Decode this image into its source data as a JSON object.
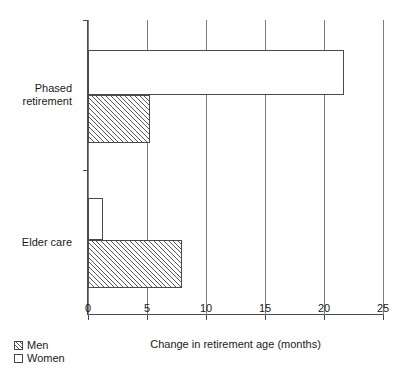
{
  "chart_data": {
    "type": "bar",
    "orientation": "horizontal",
    "title": "",
    "xlabel": "Change in retirement age (months)",
    "ylabel": "",
    "xlim": [
      0,
      25
    ],
    "xticks": [
      0,
      5,
      10,
      15,
      20,
      25
    ],
    "xticklabels": [
      "0",
      "5",
      "10",
      "15",
      "20",
      "25"
    ],
    "categories": [
      "Phased retirement",
      "Elder care"
    ],
    "grid": "vertical",
    "legend_position": "bottom-left",
    "series": [
      {
        "name": "Men",
        "values": [
          5.25,
          8.0
        ],
        "fill": "hatched",
        "edge_color": "#4a4a4a"
      },
      {
        "name": "Women",
        "values": [
          21.7,
          1.3
        ],
        "fill": "white",
        "edge_color": "#4a4a4a"
      }
    ]
  },
  "axis": {
    "x_title": "Change in retirement age (months)",
    "ticks": [
      {
        "value": 0,
        "label": "0"
      },
      {
        "value": 5,
        "label": "5"
      },
      {
        "value": 10,
        "label": "10"
      },
      {
        "value": 15,
        "label": "15"
      },
      {
        "value": 20,
        "label": "20"
      },
      {
        "value": 25,
        "label": "25"
      }
    ]
  },
  "categories": [
    {
      "label": "Phased\nretirement"
    },
    {
      "label": "Elder care"
    }
  ],
  "legend": {
    "items": [
      {
        "label": "Men",
        "style": "men"
      },
      {
        "label": "Women",
        "style": "women"
      }
    ]
  },
  "colors": {
    "axis": "#4a4a4a",
    "grid": "#7d7d7d",
    "bar_edge": "#4a4a4a",
    "bar_fill_women": "#ffffff",
    "text": "#1a1a1a"
  }
}
